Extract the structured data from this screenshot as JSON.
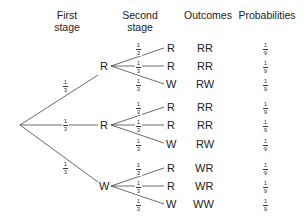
{
  "headers": {
    "first_stage_1": "First",
    "first_stage_2": "stage",
    "second_stage_1": "Second",
    "second_stage_2": "stage",
    "outcomes": "Outcomes",
    "probabilities": "Probabilities"
  },
  "first_stage": {
    "nodes": [
      "R",
      "R",
      "W"
    ],
    "branch_prob": {
      "num": "1",
      "den": "3"
    }
  },
  "second_stage": {
    "groups": [
      {
        "leaves": [
          "R",
          "R",
          "W"
        ],
        "outcomes": [
          "RR",
          "RR",
          "RW"
        ]
      },
      {
        "leaves": [
          "R",
          "R",
          "W"
        ],
        "outcomes": [
          "RR",
          "RR",
          "RW"
        ]
      },
      {
        "leaves": [
          "R",
          "R",
          "W"
        ],
        "outcomes": [
          "WR",
          "WR",
          "WW"
        ]
      }
    ],
    "branch_prob": {
      "num": "1",
      "den": "3"
    }
  },
  "probability": {
    "num": "1",
    "den": "9"
  },
  "colors": {
    "line": "#444444",
    "text": "#222222"
  }
}
